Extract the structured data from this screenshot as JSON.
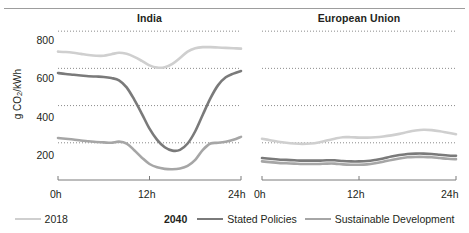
{
  "figure": {
    "ylabel": "g CO",
    "ylabel_sub": "2",
    "ylabel_tail": "/kWh"
  },
  "panels": [
    {
      "key": "india",
      "title": "India"
    },
    {
      "key": "eu",
      "title": "European Union"
    }
  ],
  "axis": {
    "yticks": [
      "800",
      "600",
      "400",
      "200"
    ],
    "xticks": [
      "0h",
      "12h",
      "24h"
    ]
  },
  "legend": {
    "items": [
      {
        "label": "2018",
        "color": "#cfcfcf"
      },
      {
        "label": "Stated Policies",
        "color": "#7a7a7a"
      },
      {
        "label": "Sustainable Development",
        "color": "#a6a6a6"
      }
    ],
    "group_label": "2040"
  },
  "colors": {
    "s2018": "#cfcfcf",
    "stated_policies": "#7a7a7a",
    "sustainable_development": "#a6a6a6",
    "gridline": "#8a8a8a",
    "axis": "#7b7b7b",
    "text": "#231f20"
  },
  "chart_data": {
    "type": "line",
    "title": "",
    "xlabel": "",
    "ylabel": "g CO2/kWh",
    "ylim": [
      0,
      860
    ],
    "xlim": [
      0,
      24
    ],
    "grid": true,
    "gridlines_y": [
      800,
      600,
      400,
      200
    ],
    "xticks": [
      0,
      12,
      24
    ],
    "xticklabels": [
      "0h",
      "12h",
      "24h"
    ],
    "legend_position": "bottom",
    "x": [
      0,
      1,
      2,
      3,
      4,
      5,
      6,
      7,
      8,
      9,
      10,
      11,
      12,
      13,
      14,
      15,
      16,
      17,
      18,
      19,
      20,
      21,
      22,
      23,
      24
    ],
    "panels": [
      {
        "name": "India",
        "series": [
          {
            "name": "2018",
            "values": [
              690,
              688,
              684,
              678,
              672,
              668,
              668,
              676,
              684,
              678,
              662,
              640,
              616,
              604,
              606,
              624,
              656,
              690,
              708,
              714,
              714,
              712,
              710,
              708,
              706
            ]
          },
          {
            "name": "Stated Policies",
            "values": [
              575,
              570,
              566,
              562,
              558,
              556,
              554,
              548,
              536,
              498,
              432,
              356,
              276,
              216,
              176,
              158,
              162,
              196,
              262,
              352,
              440,
              510,
              552,
              572,
              586
            ]
          },
          {
            "name": "Sustainable Development",
            "values": [
              226,
              222,
              218,
              212,
              208,
              204,
              202,
              200,
              206,
              196,
              160,
              120,
              86,
              68,
              60,
              58,
              62,
              76,
              108,
              162,
              196,
              200,
              206,
              216,
              232
            ]
          }
        ]
      },
      {
        "name": "European Union",
        "series": [
          {
            "name": "2018",
            "values": [
              222,
              214,
              206,
              200,
              196,
              194,
              196,
              202,
              212,
              222,
              230,
              230,
              228,
              228,
              230,
              234,
              240,
              248,
              258,
              266,
              270,
              268,
              262,
              254,
              246
            ]
          },
          {
            "name": "Stated Policies",
            "values": [
              118,
              114,
              110,
              108,
              106,
              104,
              104,
              104,
              106,
              106,
              102,
              100,
              100,
              102,
              108,
              116,
              126,
              134,
              140,
              142,
              142,
              140,
              136,
              132,
              130
            ]
          },
          {
            "name": "Sustainable Development",
            "values": [
              100,
              96,
              92,
              90,
              88,
              86,
              86,
              86,
              88,
              88,
              84,
              82,
              82,
              84,
              90,
              98,
              108,
              116,
              122,
              124,
              124,
              122,
              118,
              114,
              112
            ]
          }
        ]
      }
    ]
  }
}
